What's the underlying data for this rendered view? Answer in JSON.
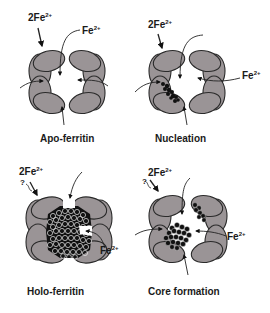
{
  "figure": {
    "panels": [
      {
        "id": "apo",
        "title": "Apo-ferritin",
        "ion_left": "2Fe",
        "ion_right": "Fe",
        "charge": "2+"
      },
      {
        "id": "nucleation",
        "title": "Nucleation",
        "ion_left": "2Fe",
        "ion_right": "Fe",
        "charge": "2+"
      },
      {
        "id": "holo",
        "title": "Holo-ferritin",
        "ion_left": "2Fe",
        "ion_right": "Fe",
        "charge": "2+",
        "annotation": "?"
      },
      {
        "id": "core",
        "title": "Core formation",
        "ion_left": "2Fe",
        "ion_right": "Fe",
        "charge": "2+",
        "annotation": "?"
      }
    ],
    "colors": {
      "subunit_fill": "#9a9496",
      "subunit_stroke": "#2a2a2a",
      "iron_fill": "#111111",
      "text": "#1a1a1a"
    }
  }
}
